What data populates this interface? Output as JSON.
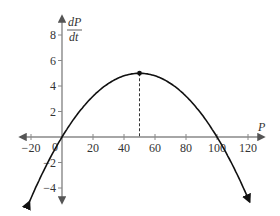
{
  "chart_data": {
    "type": "line",
    "title": "",
    "xlabel": "P",
    "ylabel_numerator": "dP",
    "ylabel_denominator": "dt",
    "function": "dP/dt = 0.2P - 0.002P^2 (downward parabola)",
    "x": [
      -20,
      -10,
      0,
      10,
      20,
      30,
      40,
      50,
      60,
      70,
      80,
      90,
      100,
      110,
      120
    ],
    "series": [
      {
        "name": "dP/dt",
        "values": [
          -4.8,
          -2.2,
          0,
          1.8,
          3.2,
          4.2,
          4.8,
          5,
          4.8,
          4.2,
          3.2,
          1.8,
          0,
          -2.2,
          -4.8
        ]
      }
    ],
    "xlim": [
      -25,
      130
    ],
    "ylim": [
      -5.5,
      9
    ],
    "x_ticks": [
      -20,
      0,
      20,
      40,
      60,
      80,
      100,
      120
    ],
    "x_tick_labels": [
      "−20",
      "0",
      "20",
      "40",
      "60",
      "80",
      "100",
      "120"
    ],
    "y_ticks": [
      -4,
      -2,
      2,
      4,
      6,
      8
    ],
    "y_tick_labels": [
      "−4",
      "−2",
      "2",
      "4",
      "6",
      "8"
    ],
    "annotations": [
      {
        "type": "point",
        "x": 50,
        "y": 5,
        "label": "maximum"
      },
      {
        "type": "dashed-vertical",
        "x": 50,
        "from_y": 0,
        "to_y": 5
      }
    ],
    "grid": false,
    "legend": "none"
  },
  "colors": {
    "axis": "#888888",
    "curve": "#111111",
    "text": "#333333"
  }
}
